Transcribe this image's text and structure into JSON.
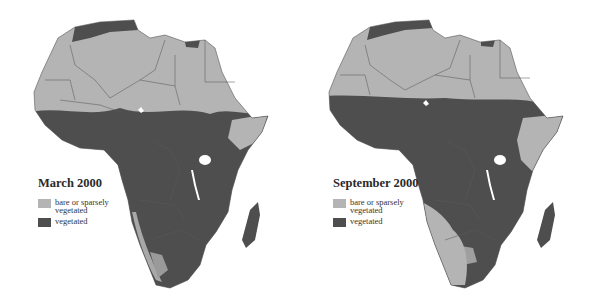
{
  "colors": {
    "bare": "#b4b4b4",
    "vegetated": "#4e4e4e",
    "border": "#5a5a5a",
    "background": "#ffffff"
  },
  "maps": [
    {
      "title": "March 2000",
      "legend": [
        {
          "label": "bare or sparsely vegetated",
          "color": "#b4b4b4"
        },
        {
          "label": "vegetated",
          "color": "#4e4e4e"
        }
      ]
    },
    {
      "title": "September 2000",
      "legend": [
        {
          "label": "bare or sparsely vegetated",
          "color": "#b4b4b4"
        },
        {
          "label": "vegetated",
          "color": "#4e4e4e"
        }
      ]
    }
  ]
}
